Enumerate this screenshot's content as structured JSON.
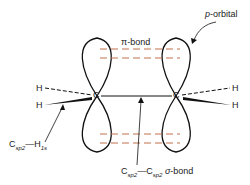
{
  "diagram": {
    "labels": {
      "p_orbital": "p-orbital",
      "p_orbital_p": "p",
      "p_orbital_rest": "-orbital",
      "pi_bond": "π-bond",
      "carbon_left": "C",
      "carbon_right": "C",
      "h_top_left": "H",
      "h_bottom_left": "H",
      "h_top_right": "H",
      "h_bottom_right": "H",
      "csp2_h1s": {
        "c": "C",
        "c_sub": "sp2",
        "dash": "—",
        "h": "H",
        "h_sub": "1s"
      },
      "sigma_bond": {
        "c1": "C",
        "c1_sub": "sp2",
        "dash": "—",
        "c2": "C",
        "c2_sub": "sp2",
        "sigma": "σ",
        "rest": "-bond"
      }
    },
    "colors": {
      "line": "#111111",
      "pi_dash": "#c0704a",
      "text": "#222222"
    }
  }
}
